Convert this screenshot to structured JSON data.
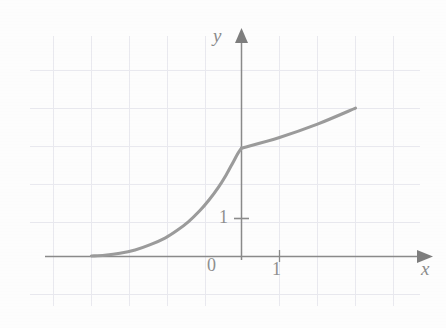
{
  "figure": {
    "background_color": "#fdfdfd",
    "width": 446,
    "height": 328
  },
  "axis_labels": {
    "x": "x",
    "y": "y",
    "origin": "0",
    "x_tick_one": "1",
    "y_tick_one": "1"
  },
  "colors": {
    "grid": "#e9e9ef",
    "axis": "#8a8a8a",
    "curve": "#9b9b9b",
    "label": "#8b8b8b"
  },
  "chart_data": {
    "type": "line",
    "title": "",
    "xlabel": "x",
    "ylabel": "y",
    "grid": true,
    "legend": null,
    "xlim": [
      -4.95,
      4.0
    ],
    "ylim": [
      -0.9,
      4.9
    ],
    "x_ticks": [
      0,
      1
    ],
    "x_tick_labels": [
      "0",
      "1"
    ],
    "y_ticks": [
      1
    ],
    "y_tick_labels": [
      "1"
    ],
    "grid_spacing_units": 1,
    "series": [
      {
        "name": "piecewise-curve",
        "comment": "exponential-like rise, tangent to x-axis on the left, with a corner at x = 0 then a gentle straight line",
        "points": [
          [
            -3.95,
            0.0
          ],
          [
            -3.6,
            0.02
          ],
          [
            -3.2,
            0.07
          ],
          [
            -2.8,
            0.16
          ],
          [
            -2.4,
            0.3
          ],
          [
            -2.0,
            0.48
          ],
          [
            -1.7,
            0.67
          ],
          [
            -1.4,
            0.9
          ],
          [
            -1.1,
            1.19
          ],
          [
            -0.85,
            1.48
          ],
          [
            -0.6,
            1.82
          ],
          [
            -0.4,
            2.14
          ],
          [
            -0.22,
            2.47
          ],
          [
            -0.1,
            2.69
          ],
          [
            0.0,
            2.84
          ]
        ]
      },
      {
        "name": "straight-segment",
        "comment": "linear piece to the right of the corner, slope approximately 0.35",
        "points": [
          [
            0.0,
            2.84
          ],
          [
            1.0,
            3.12
          ],
          [
            2.0,
            3.47
          ],
          [
            3.0,
            3.89
          ]
        ]
      }
    ]
  }
}
